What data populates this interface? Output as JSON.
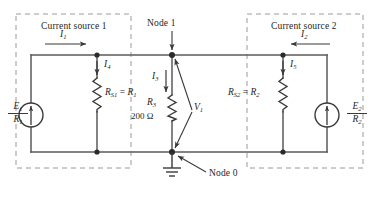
{
  "figure": {
    "type": "circuit-schematic",
    "background_color": "#ffffff",
    "wire_color": "#5a5a5a",
    "dash_color": "#9a9a9a",
    "text_color": "#262626"
  },
  "boxes": {
    "left": {
      "label": "Current source 1"
    },
    "right": {
      "label": "Current source 2"
    }
  },
  "nodes": {
    "node1": {
      "label": "Node 1"
    },
    "node0": {
      "label": "Node 0"
    }
  },
  "sources": {
    "left": {
      "numerator": "E",
      "numerator_sub": "1",
      "denominator": "R",
      "denominator_sub": "1",
      "direction": "up"
    },
    "right": {
      "numerator": "E",
      "numerator_sub": "2",
      "denominator": "R",
      "denominator_sub": "2",
      "direction": "up"
    }
  },
  "resistors": {
    "rs1": {
      "label": "R",
      "sub": "S1",
      "equals": "=",
      "equiv": "R",
      "equiv_sub": "1"
    },
    "rs2": {
      "label": "R",
      "sub": "S2",
      "equals": "=",
      "equiv": "R",
      "equiv_sub": "2"
    },
    "r3": {
      "label": "R",
      "sub": "3",
      "value": "200 Ω"
    }
  },
  "currents": {
    "i1": {
      "label": "I",
      "sub": "1",
      "direction": "right"
    },
    "i2": {
      "label": "I",
      "sub": "2",
      "direction": "left"
    },
    "i3": {
      "label": "I",
      "sub": "3",
      "direction": "down"
    },
    "i4": {
      "label": "I",
      "sub": "4",
      "direction": "down"
    },
    "i5": {
      "label": "I",
      "sub": "5",
      "direction": "down"
    }
  },
  "voltages": {
    "v1": {
      "label": "V",
      "sub": "1",
      "across": "node1-to-node0"
    }
  },
  "ground": {
    "at": "node0",
    "symbol": "earth-ground"
  }
}
